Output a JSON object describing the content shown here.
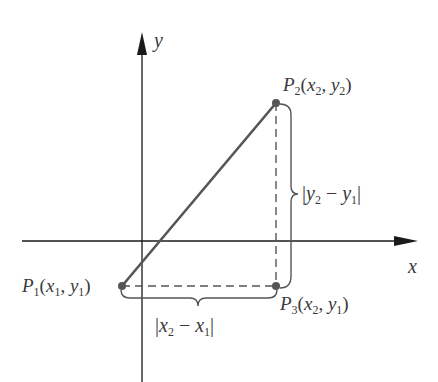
{
  "figure": {
    "axes": {
      "x_label": "x",
      "y_label": "y"
    },
    "points": [
      {
        "id": "P1",
        "name": "P",
        "sub": "1",
        "coord_x": "x",
        "coord_x_sub": "1",
        "coord_y": "y",
        "coord_y_sub": "1"
      },
      {
        "id": "P2",
        "name": "P",
        "sub": "2",
        "coord_x": "x",
        "coord_x_sub": "2",
        "coord_y": "y",
        "coord_y_sub": "2"
      },
      {
        "id": "P3",
        "name": "P",
        "sub": "3",
        "coord_x": "x",
        "coord_x_sub": "2",
        "coord_y": "y",
        "coord_y_sub": "1"
      }
    ],
    "braces": {
      "vertical": {
        "a": "y",
        "a_sub": "2",
        "op": "−",
        "b": "y",
        "b_sub": "1"
      },
      "horizontal": {
        "a": "x",
        "a_sub": "2",
        "op": "−",
        "b": "x",
        "b_sub": "1"
      }
    },
    "colors": {
      "axis": "#1a1a1a",
      "segment": "#555555",
      "dashed": "#555555",
      "point": "#555555",
      "label": "#3a3a3a"
    }
  }
}
